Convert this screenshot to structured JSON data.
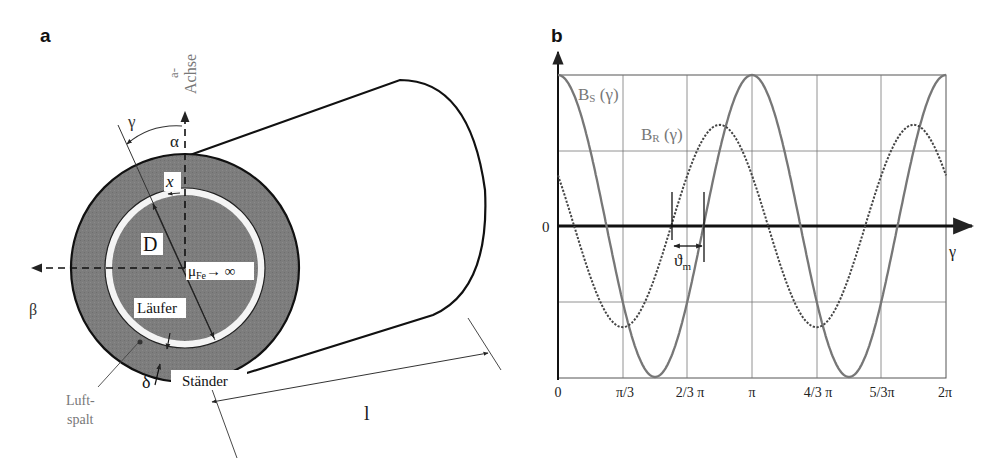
{
  "panel_a": {
    "label": "a",
    "axis_label_line1": "a-",
    "axis_label_line2": "Achse",
    "gamma": "γ",
    "alpha": "α",
    "beta": "β",
    "x": "x",
    "diameter": "D",
    "mu_main": "μ",
    "mu_sub": "Fe",
    "mu_tail": "→ ∞",
    "rotor": "Läufer",
    "stator": "Ständer",
    "delta": "δ",
    "airgap_line1": "Luft-",
    "airgap_line2": "spalt",
    "length": "l"
  },
  "panel_b": {
    "label": "b",
    "zero_label": "0",
    "gamma_label": "γ",
    "bs_main": "B",
    "bs_sub": "S",
    "bs_arg": " (γ)",
    "br_main": "B",
    "br_sub": "R",
    "br_arg": " (γ)",
    "theta_main": "ϑ",
    "theta_sub": "m",
    "x_ticks": [
      "0",
      "π/3",
      "2/3 π",
      "π",
      "4/3 π",
      "5/3π",
      "2π"
    ]
  },
  "chart_data": {
    "type": "line",
    "title": "",
    "xlabel": "γ",
    "ylabel": "",
    "x_ticks": [
      "0",
      "π/3",
      "2/3 π",
      "π",
      "4/3 π",
      "5/3π",
      "2π"
    ],
    "xlim": [
      0,
      6.2832
    ],
    "ylim": [
      -1,
      1
    ],
    "grid": true,
    "series": [
      {
        "name": "B_S(γ)",
        "style": "solid",
        "formula": "cos(2γ)",
        "amplitude": 1.0,
        "x": [
          0,
          0.5236,
          1.0472,
          1.5708,
          2.0944,
          2.618,
          3.1416,
          3.6652,
          4.1888,
          4.7124,
          5.236,
          5.7596,
          6.2832
        ],
        "values": [
          1.0,
          0.5,
          -0.5,
          -1.0,
          -0.5,
          0.5,
          1.0,
          0.5,
          -0.5,
          -1.0,
          -0.5,
          0.5,
          1.0
        ]
      },
      {
        "name": "B_R(γ)",
        "style": "dotted",
        "formula": "0.67·cos(2γ + π/3)",
        "amplitude": 0.67,
        "x": [
          0,
          0.5236,
          1.0472,
          1.5708,
          2.0944,
          2.618,
          3.1416,
          3.6652,
          4.1888,
          4.7124,
          5.236,
          5.7596,
          6.2832
        ],
        "values": [
          0.33,
          -0.33,
          -0.67,
          -0.33,
          0.33,
          0.67,
          0.33,
          -0.33,
          -0.67,
          -0.33,
          0.33,
          0.67,
          0.33
        ]
      }
    ],
    "annotations": [
      "B_S (γ)",
      "B_R (γ)",
      "ϑ_m",
      "0"
    ]
  }
}
